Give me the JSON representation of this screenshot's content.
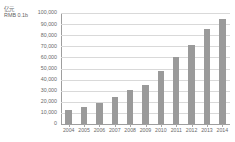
{
  "unit_label": {
    "line1": "亿元",
    "line2": "RMB 0.1b"
  },
  "chart_data": {
    "type": "bar",
    "title": "",
    "xlabel": "",
    "ylabel": "亿元 / RMB 0.1b",
    "categories": [
      "2004",
      "2005",
      "2006",
      "2007",
      "2008",
      "2009",
      "2010",
      "2011",
      "2012",
      "2013",
      "2014"
    ],
    "values": [
      12500,
      15500,
      19000,
      24500,
      31000,
      35500,
      47500,
      60500,
      71000,
      85500,
      95000
    ],
    "ylim": [
      0,
      100000
    ],
    "yticks": [
      0,
      10000,
      20000,
      30000,
      40000,
      50000,
      60000,
      70000,
      80000,
      90000,
      100000
    ],
    "ytick_labels": [
      "0",
      "10,000",
      "20,000",
      "30,000",
      "40,000",
      "50,000",
      "60,000",
      "70,000",
      "80,000",
      "90,000",
      "100,000"
    ],
    "grid": true,
    "legend": "none",
    "bar_color": "#9a9a9a",
    "grid_color": "#d9d9d9",
    "axis_color": "#9e9e9e",
    "background": "#ffffff"
  }
}
